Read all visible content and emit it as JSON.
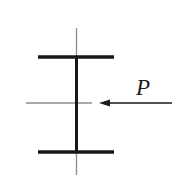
{
  "figure": {
    "name": "i-beam-cross-section-with-point-load",
    "canvas": {
      "width": 181,
      "height": 185,
      "background_color": "#ffffff"
    },
    "colors": {
      "section_stroke": "#171717",
      "centerline_stroke": "#8c8c8c",
      "arrow_stroke": "#1a1a1a",
      "label_fill": "#1a1a1a"
    }
  },
  "section": {
    "type": "I-beam",
    "top_flange": {
      "name": "top-flange",
      "x1": 38,
      "x2": 114,
      "y": 57,
      "thickness": 3.4
    },
    "bottom_flange": {
      "name": "bottom-flange",
      "x1": 38,
      "x2": 114,
      "y": 152,
      "thickness": 3.4
    },
    "web": {
      "name": "web",
      "x": 76.5,
      "y1": 56,
      "y2": 153,
      "thickness": 3.0
    }
  },
  "centerlines": {
    "vertical": {
      "name": "vertical-centerline",
      "x": 76.5,
      "y1": 28,
      "y2": 175,
      "thickness": 1.3
    },
    "horizontal": {
      "name": "horizontal-centerline",
      "y": 103,
      "x1": 26,
      "x2": 92,
      "thickness": 1.3
    }
  },
  "load": {
    "label": "P",
    "label_x": 143,
    "label_y": 95,
    "direction": "left",
    "arrow": {
      "name": "force-arrow-P",
      "tail_x": 172,
      "tip_x": 99,
      "y": 103,
      "shaft_thickness": 1.6,
      "head_length": 11,
      "head_half_width": 3.6
    }
  }
}
